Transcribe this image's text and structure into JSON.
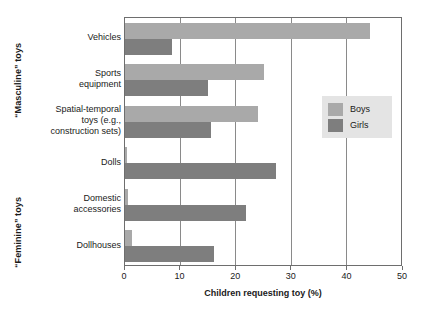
{
  "chart_data": {
    "type": "bar",
    "orientation": "horizontal",
    "title": "",
    "xlabel": "Children requesting toy (%)",
    "ylabel": "",
    "xlim": [
      0,
      50
    ],
    "xticks": [
      0,
      10,
      20,
      30,
      40,
      50
    ],
    "xtick_labels": [
      "0",
      "10",
      "20",
      "30",
      "40",
      "50"
    ],
    "grid": true,
    "grid_axis": "x",
    "legend_position": "right-middle",
    "categories": [
      "Vehicles",
      "Sports\nequipment",
      "Spatial-temporal\ntoys (e.g.,\nconstruction sets)",
      "Dolls",
      "Domestic\naccessories",
      "Dollhouses"
    ],
    "series": [
      {
        "name": "Boys",
        "color": "#a9a9a9",
        "values": [
          44,
          25,
          24,
          0.3,
          0.6,
          1.2
        ]
      },
      {
        "name": "Girls",
        "color": "#7e7e7e",
        "values": [
          8.5,
          15,
          15.5,
          27.2,
          21.8,
          16
        ]
      }
    ],
    "group_labels": [
      {
        "text": "“Masculine” toys",
        "categories": [
          "Vehicles",
          "Sports equipment",
          "Spatial-temporal toys (e.g., construction sets)"
        ]
      },
      {
        "text": "“Feminine” toys",
        "categories": [
          "Dolls",
          "Domestic accessories",
          "Dollhouses"
        ]
      }
    ]
  },
  "legend": {
    "entries": [
      {
        "label": "Boys",
        "color": "#a9a9a9"
      },
      {
        "label": "Girls",
        "color": "#7e7e7e"
      }
    ]
  },
  "axis": {
    "x_title": "Children requesting toy (%)"
  },
  "colors": {
    "boys": "#a9a9a9",
    "girls": "#7e7e7e",
    "frame": "#6e6e6e",
    "gridline": "#8a8a8a",
    "legend_background": "#e4e4e4",
    "text": "#1a1a1a",
    "background": "#ffffff"
  }
}
